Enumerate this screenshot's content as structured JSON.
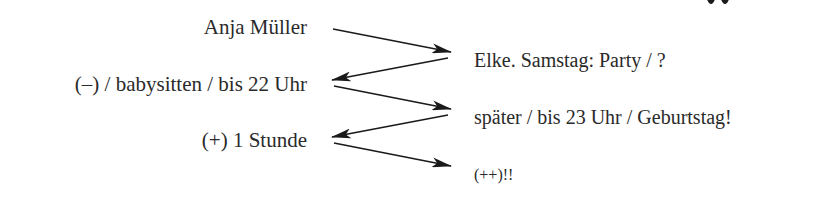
{
  "diagram": {
    "type": "dialogue-flow",
    "colors": {
      "text": "#2a2a2a",
      "arrow": "#1a1a1a",
      "background": "#ffffff"
    },
    "left_column": [
      {
        "id": "l1",
        "text": "Anja Müller"
      },
      {
        "id": "l2",
        "text": "(–) / babysitten / bis 22 Uhr"
      },
      {
        "id": "l3",
        "text": "(+) 1 Stunde"
      }
    ],
    "right_column": [
      {
        "id": "r1",
        "text": "Elke. Samstag: Party / ?"
      },
      {
        "id": "r2",
        "text": "später / bis 23 Uhr / Geburtstag!"
      },
      {
        "id": "r3",
        "text": "(++)!!"
      }
    ],
    "arrows": [
      {
        "from": "l1",
        "to": "r1",
        "direction": "right"
      },
      {
        "from": "r1",
        "to": "l2",
        "direction": "left"
      },
      {
        "from": "l2",
        "to": "r2",
        "direction": "right"
      },
      {
        "from": "r2",
        "to": "l3",
        "direction": "left"
      },
      {
        "from": "l3",
        "to": "r3",
        "direction": "right"
      }
    ]
  }
}
